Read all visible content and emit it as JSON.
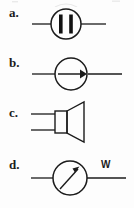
{
  "figure": {
    "kind": "multiple-choice-circuit-symbols",
    "background_color": "#fdfdfd",
    "ink_color": "#1b1b1b",
    "width": 134,
    "height": 208
  },
  "options": [
    {
      "id": "a",
      "label": "a.",
      "symbol_name": "circle-with-two-vertical-bars",
      "description": "Circle on a horizontal wire containing two thick vertical bars",
      "unit_label": ""
    },
    {
      "id": "b",
      "label": "b.",
      "symbol_name": "circle-with-right-arrow",
      "description": "Circle on a horizontal wire containing a rightward arrow",
      "unit_label": ""
    },
    {
      "id": "c",
      "label": "c.",
      "symbol_name": "loudspeaker",
      "description": "Loudspeaker: rectangle with flared horn and two parallel leads",
      "unit_label": ""
    },
    {
      "id": "d",
      "label": "d.",
      "symbol_name": "meter-with-needle",
      "description": "Meter circle with diagonal needle on a horizontal wire, labelled W",
      "unit_label": "W"
    }
  ]
}
